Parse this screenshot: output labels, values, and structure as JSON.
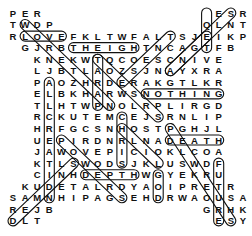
{
  "puzzle": {
    "type": "word-search",
    "grid_origin": {
      "x": 13,
      "y": 13
    },
    "cell_spacing": {
      "x": 12.1,
      "y": 11.55
    },
    "rows": [
      {
        "start_col": 0,
        "letters": "PER",
        "extra": {
          "start_col": 17,
          "letters": "ESR"
        }
      },
      {
        "start_col": 0,
        "letters": "TWDP",
        "extra": {
          "start_col": 16,
          "letters": "QLNT"
        }
      },
      {
        "start_col": 0,
        "letters": "RLOVEFKLTWFALTSJEIKP"
      },
      {
        "start_col": 1,
        "letters": "GJRBTHEIGHTNCAGTFB"
      },
      {
        "start_col": 2,
        "letters": "KNEKWTQCOESCNIVE"
      },
      {
        "start_col": 2,
        "letters": "LJBTLAOZSJNAYXRA"
      },
      {
        "start_col": 2,
        "letters": "PAOZHRDERAKGTLKR"
      },
      {
        "start_col": 2,
        "letters": "ELBKHARWSNOTHING"
      },
      {
        "start_col": 2,
        "letters": "TLHTWPNOLRPLIRGD"
      },
      {
        "start_col": 2,
        "letters": "RCKUTEMCEJSRNLIP"
      },
      {
        "start_col": 2,
        "letters": "HRFGCSNHOSTPGHJL"
      },
      {
        "start_col": 2,
        "letters": "UEPIRDNRLNADEATH"
      },
      {
        "start_col": 2,
        "letters": "JAWOVEPICIOKLCOA"
      },
      {
        "start_col": 2,
        "letters": "KTLSWODSJKLUSWDF"
      },
      {
        "start_col": 2,
        "letters": "CINHDEPTHWGYEKRU"
      },
      {
        "start_col": 1,
        "letters": "KUDETALRDYAOIPRETR"
      },
      {
        "start_col": 0,
        "letters": "SAMNHIPAGSEHDRWAOUSA"
      },
      {
        "start_col": 0,
        "letters": "REJB",
        "extra": {
          "start_col": 16,
          "letters": "GRHK"
        }
      },
      {
        "start_col": 0,
        "letters": "DLT",
        "extra": {
          "start_col": 17,
          "letters": "ESY"
        }
      }
    ],
    "found_words": [
      {
        "word": "LOVE",
        "from": [
          2,
          1
        ],
        "to": [
          2,
          4
        ]
      },
      {
        "word": "HEIGHT",
        "from": [
          3,
          5
        ],
        "to": [
          3,
          10
        ]
      },
      {
        "word": "NOTHING",
        "from": [
          7,
          11
        ],
        "to": [
          7,
          17
        ]
      },
      {
        "word": "DEATH",
        "from": [
          11,
          13
        ],
        "to": [
          11,
          17
        ]
      },
      {
        "word": "DEPTH",
        "from": [
          14,
          6
        ],
        "to": [
          14,
          10
        ]
      },
      {
        "word": "FUTURES",
        "from": [
          13,
          17
        ],
        "to": [
          18,
          17
        ]
      },
      {
        "word": "GOD",
        "from": [
          14,
          12
        ],
        "to": [
          16,
          12
        ]
      },
      {
        "word": "FINE",
        "from": [
          3,
          16
        ],
        "to": [
          0,
          16
        ]
      },
      {
        "word": "HISTORY",
        "from": [
          10,
          9
        ],
        "to": [
          13,
          12
        ]
      },
      {
        "word": "PRESENT",
        "from": [
          8,
          7
        ],
        "to": [
          4,
          7
        ]
      },
      {
        "word": "ALLCREATION",
        "from": [
          6,
          3
        ],
        "to": [
          16,
          3
        ]
      },
      {
        "word": "CHRIS",
        "from": [
          9,
          9
        ],
        "to": [
          13,
          9
        ]
      },
      {
        "word": "PEACE",
        "from": [
          11,
          4
        ],
        "to": [
          16,
          9
        ]
      },
      {
        "word": "THINGS",
        "from": [
          4,
          7
        ],
        "to": [
          9,
          12
        ]
      },
      {
        "word": "WEAKNESS",
        "from": [
          1,
          1
        ],
        "to": [
          8,
          8
        ]
      },
      {
        "word": "ANGELS",
        "from": [
          5,
          13
        ],
        "to": [
          0,
          18
        ]
      },
      {
        "word": "SWORD",
        "from": [
          13,
          5
        ],
        "to": [
          18,
          0
        ]
      },
      {
        "word": "AJAX",
        "from": [
          5,
          13
        ],
        "to": [
          2,
          16
        ]
      },
      {
        "word": "POWERS",
        "from": [
          10,
          13
        ],
        "to": [
          18,
          18
        ]
      },
      {
        "word": "TRUST",
        "from": [
          2,
          13
        ],
        "to": [
          6,
          9
        ]
      }
    ],
    "colors": {
      "letters": "#111111",
      "outline": "#111111",
      "background": "#ffffff"
    }
  }
}
